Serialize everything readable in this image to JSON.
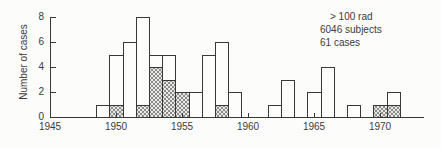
{
  "chart_data": {
    "type": "bar",
    "title": "",
    "xlabel": "",
    "ylabel": "Number of cases",
    "x_ticks": [
      1945,
      1950,
      1955,
      1960,
      1965,
      1970
    ],
    "y_ticks": [
      0,
      2,
      4,
      6,
      8
    ],
    "xlim": [
      1945,
      1973
    ],
    "ylim": [
      0,
      8
    ],
    "grid": false,
    "legend_position": "none",
    "annotation": [
      "> 100 rad",
      "6046 subjects",
      "61 cases"
    ],
    "series": [
      {
        "name": "all cases",
        "style": "open-bar"
      },
      {
        "name": "shaded subset of cases",
        "style": "stippled-bar"
      }
    ],
    "bars": [
      {
        "year": 1949,
        "total": 1,
        "shaded": 0
      },
      {
        "year": 1950,
        "total": 5,
        "shaded": 1
      },
      {
        "year": 1951,
        "total": 6,
        "shaded": 0
      },
      {
        "year": 1952,
        "total": 8,
        "shaded": 1
      },
      {
        "year": 1953,
        "total": 5,
        "shaded": 4
      },
      {
        "year": 1954,
        "total": 5,
        "shaded": 3
      },
      {
        "year": 1955,
        "total": 2,
        "shaded": 2
      },
      {
        "year": 1956,
        "total": 2,
        "shaded": 0
      },
      {
        "year": 1957,
        "total": 5,
        "shaded": 0
      },
      {
        "year": 1958,
        "total": 6,
        "shaded": 1
      },
      {
        "year": 1959,
        "total": 2,
        "shaded": 0
      },
      {
        "year": 1962,
        "total": 1,
        "shaded": 0
      },
      {
        "year": 1963,
        "total": 3,
        "shaded": 0
      },
      {
        "year": 1965,
        "total": 2,
        "shaded": 0
      },
      {
        "year": 1966,
        "total": 4,
        "shaded": 0
      },
      {
        "year": 1968,
        "total": 1,
        "shaded": 0
      },
      {
        "year": 1970,
        "total": 1,
        "shaded": 1
      },
      {
        "year": 1971,
        "total": 2,
        "shaded": 1
      }
    ]
  },
  "colors": {
    "outline": "#383838",
    "bar_fill": "#fdfdfc",
    "stipple_bg": "#eae8e3",
    "stipple_dot": "#8c8c8c",
    "text": "#3b3b3b",
    "background": "#fcfcfb"
  }
}
